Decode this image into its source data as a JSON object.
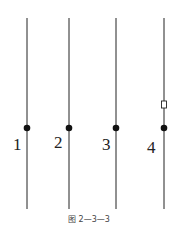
{
  "figure": {
    "caption": "图 2—3—3",
    "lines": [
      {
        "label": "1",
        "x": 27,
        "dot_y": 128,
        "label_x": 13,
        "label_y": 150
      },
      {
        "label": "2",
        "x": 69,
        "dot_y": 128,
        "label_x": 54,
        "label_y": 148
      },
      {
        "label": "3",
        "x": 116,
        "dot_y": 128,
        "label_x": 102,
        "label_y": 150
      },
      {
        "label": "4",
        "x": 164,
        "dot_y": 128,
        "label_x": 147,
        "label_y": 153,
        "marker": "small-rectangle",
        "marker_y": 105
      }
    ],
    "line_top": 18,
    "line_bottom": 209,
    "colors": {
      "line": "#222222",
      "dot": "#111111",
      "background": "#ffffff"
    }
  }
}
